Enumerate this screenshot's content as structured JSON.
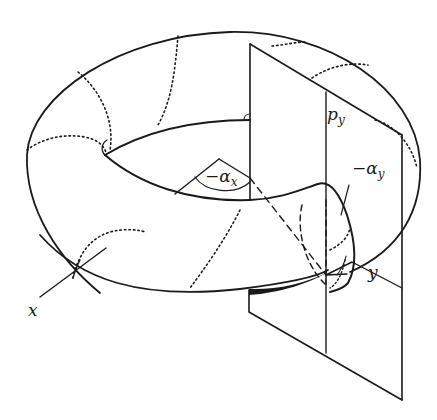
{
  "diagram": {
    "type": "torus-with-cross-section-plane",
    "labels": {
      "p_main": "p",
      "p_sub": "y",
      "alpha_y_prefix": "−α",
      "alpha_y_sub": "y",
      "alpha_x_prefix": "−α",
      "alpha_x_sub": "x",
      "y_axis": "y",
      "x_axis": "x"
    },
    "colors": {
      "ink": "#1a1a1a",
      "background": "#ffffff"
    }
  }
}
